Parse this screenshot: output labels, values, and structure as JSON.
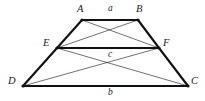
{
  "figure": {
    "canvas": {
      "width": 205,
      "height": 101
    },
    "background_color": "#ffffff",
    "stroke_color": "#111111",
    "thick_stroke_width": 2.1,
    "thin_stroke_width": 0.6,
    "vertex_dot_radius": 1.6,
    "vertices": [
      {
        "id": "A",
        "label": "A",
        "x": 82,
        "y": 20,
        "label_x": 77,
        "label_y": 4
      },
      {
        "id": "B",
        "label": "B",
        "x": 138,
        "y": 20,
        "label_x": 136,
        "label_y": 4
      },
      {
        "id": "E",
        "label": "E",
        "x": 57,
        "y": 48,
        "label_x": 43,
        "label_y": 38
      },
      {
        "id": "F",
        "label": "F",
        "x": 159,
        "y": 48,
        "label_x": 163,
        "label_y": 38
      },
      {
        "id": "D",
        "label": "D",
        "x": 23,
        "y": 86,
        "label_x": 8,
        "label_y": 76
      },
      {
        "id": "C",
        "label": "C",
        "x": 188,
        "y": 86,
        "label_x": 191,
        "label_y": 76
      }
    ],
    "thick_edges": [
      {
        "name": "edge-AB",
        "from": "A",
        "to": "B"
      },
      {
        "name": "edge-EF",
        "from": "E",
        "to": "F"
      },
      {
        "name": "edge-DC",
        "from": "D",
        "to": "C"
      },
      {
        "name": "edge-AE",
        "from": "A",
        "to": "E"
      },
      {
        "name": "edge-ED",
        "from": "E",
        "to": "D"
      },
      {
        "name": "edge-BF",
        "from": "B",
        "to": "F"
      },
      {
        "name": "edge-FC",
        "from": "F",
        "to": "C"
      }
    ],
    "thin_edges": [
      {
        "name": "diagonal-AF",
        "from": "A",
        "to": "F"
      },
      {
        "name": "diagonal-BE",
        "from": "B",
        "to": "E"
      },
      {
        "name": "diagonal-DF",
        "from": "D",
        "to": "F"
      },
      {
        "name": "diagonal-EC",
        "from": "E",
        "to": "C"
      }
    ],
    "segment_labels": [
      {
        "id": "a",
        "label": "a",
        "x": 108,
        "y": 4
      },
      {
        "id": "c",
        "label": "c",
        "x": 108,
        "y": 50
      },
      {
        "id": "b",
        "label": "b",
        "x": 108,
        "y": 88
      }
    ]
  }
}
